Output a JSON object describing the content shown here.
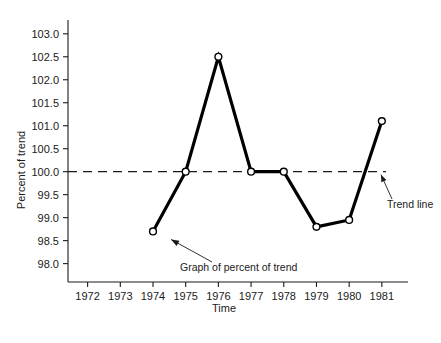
{
  "chart_data": {
    "type": "line",
    "title": "",
    "xlabel": "Time",
    "ylabel": "Percent of trend",
    "x": [
      1974,
      1975,
      1976,
      1977,
      1978,
      1979,
      1980,
      1981
    ],
    "values": [
      98.7,
      100.0,
      102.5,
      100.0,
      100.0,
      98.8,
      98.95,
      101.1
    ],
    "series": [
      {
        "name": "Graph of percent of trend",
        "values": [
          98.7,
          100.0,
          102.5,
          100.0,
          100.0,
          98.8,
          98.95,
          101.1
        ]
      }
    ],
    "xticks": [
      1972,
      1973,
      1974,
      1975,
      1976,
      1977,
      1978,
      1979,
      1980,
      1981
    ],
    "xtick_labels": [
      "1972",
      "1973",
      "1974",
      "1975",
      "1976",
      "1977",
      "1978",
      "1979",
      "1980",
      "1981"
    ],
    "yticks": [
      98.0,
      98.5,
      99.0,
      99.5,
      100.0,
      100.5,
      101.0,
      101.5,
      102.0,
      102.5,
      103.0
    ],
    "ytick_labels": [
      "98.0",
      "98.5",
      "99.0",
      "99.5",
      "100.0",
      "100.5",
      "101.0",
      "101.5",
      "102.0",
      "102.5",
      "103.0"
    ],
    "ylim": [
      97.6,
      103.3
    ],
    "xlim": [
      1971.4,
      1981.8
    ],
    "grid": false,
    "legend": "none",
    "reference_line": {
      "label": "Trend line",
      "value": 100.0,
      "style": "dashed"
    },
    "annotations": [
      {
        "label": "Graph of percent of trend",
        "points_to": "1974 data point"
      },
      {
        "label": "Trend line",
        "points_to": "dashed horizontal line at 100.0"
      }
    ],
    "marker_style": "open-circle",
    "line_color": "#000000",
    "marker_fill": "#ffffff"
  },
  "axis": {
    "ylabel": "Percent of trend",
    "xlabel": "Time"
  },
  "annotations": {
    "series_note": "Graph of percent of trend",
    "trend_note": "Trend line"
  }
}
